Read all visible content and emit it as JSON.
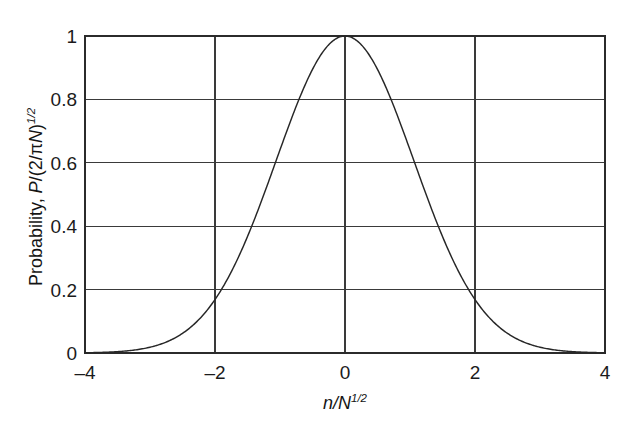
{
  "chart_data": {
    "type": "line",
    "title": "",
    "subtitle": "",
    "xlabel": "n/N^1/2",
    "xlabel_parts": {
      "var1": "n",
      "slash": "/",
      "var2": "N",
      "exponent": "1/2"
    },
    "ylabel": "Probability, P/(2/πN)^1/2",
    "ylabel_parts": {
      "lead": "Probability, ",
      "var1": "P",
      "mid": "/(2/π",
      "var2": "N",
      "close": ")",
      "exponent": "1/2"
    },
    "xlim": [
      -4,
      4
    ],
    "ylim": [
      0,
      1
    ],
    "xticks": [
      -4,
      -2,
      0,
      2,
      4
    ],
    "xticklabels": [
      "–4",
      "–2",
      "0",
      "2",
      "4"
    ],
    "yticks": [
      0,
      0.2,
      0.4,
      0.6,
      0.8,
      1
    ],
    "yticklabels": [
      "0",
      "0.2",
      "0.4",
      "0.6",
      "0.8",
      "1"
    ],
    "grid": true,
    "grid_x_values": [
      -2,
      0,
      2
    ],
    "grid_y_values": [
      0.2,
      0.4,
      0.6,
      0.8,
      1
    ],
    "legend": null,
    "legend_position": "none",
    "annotations": [],
    "series": [
      {
        "name": "Gaussian probability distribution",
        "formula": "exp(-x^2 / (2 * 1.06^2))",
        "x": [
          -4,
          -3.8,
          -3.6,
          -3.4,
          -3.2,
          -3,
          -2.8,
          -2.6,
          -2.4,
          -2.2,
          -2,
          -1.8,
          -1.6,
          -1.4,
          -1.2,
          -1,
          -0.8,
          -0.6,
          -0.4,
          -0.2,
          0,
          0.2,
          0.4,
          0.6,
          0.8,
          1,
          1.2,
          1.4,
          1.6,
          1.8,
          2,
          2.2,
          2.4,
          2.6,
          2.8,
          3,
          3.2,
          3.4,
          3.6,
          3.8,
          4
        ],
        "values": [
          0.0012,
          0.0022,
          0.0039,
          0.0068,
          0.0114,
          0.0187,
          0.0297,
          0.0459,
          0.0687,
          0.0999,
          0.1409,
          0.1929,
          0.2561,
          0.3296,
          0.4111,
          0.4972,
          0.5832,
          0.6641,
          0.7346,
          0.79,
          0.8268,
          0.8427,
          0.8368,
          0.81,
          0.7645,
          0.704,
          0.6331,
          0.5565,
          0.4791,
          0.4049,
          0.3369,
          0.2768,
          0.2252,
          0.1817,
          0.1457,
          0.1162,
          0.0924,
          0.0733,
          0.058,
          0.0459,
          0.0363
        ]
      }
    ],
    "colors": {
      "curve": "#272727",
      "grid": "#3a3a3a",
      "frame": "#2b2b2b",
      "background": "#ffffff",
      "text": "#1a1a1a"
    }
  }
}
